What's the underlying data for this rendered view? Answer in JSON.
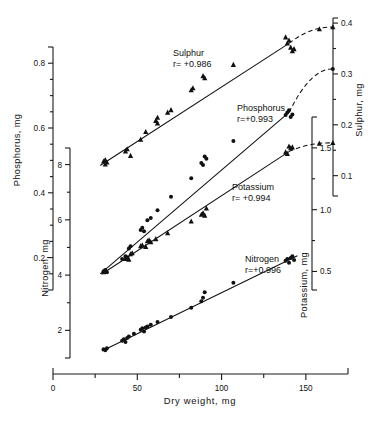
{
  "chart_data": {
    "type": "scatter",
    "title": "",
    "xlabel": "Dry weight,   mg",
    "xlim": [
      0,
      175
    ],
    "xticks": [
      0,
      50,
      100,
      150
    ],
    "xminorticks": [
      25,
      75,
      125
    ],
    "grid": false,
    "legend_position": "inline-annotations",
    "axes": [
      {
        "name": "phosphorus-axis",
        "title": "Phosphorus,   mg",
        "side": "left",
        "position_index": 1,
        "lim": [
          0.1,
          0.85
        ],
        "ticks": [
          0.2,
          0.4,
          0.6,
          0.8
        ],
        "ticklabels": [
          "0.2",
          "0.4",
          "0.6",
          "0.8"
        ],
        "minorticks": [
          0.15,
          0.25,
          0.3,
          0.35,
          0.45,
          0.5,
          0.55,
          0.65,
          0.7,
          0.75
        ]
      },
      {
        "name": "nitrogen-axis",
        "title": "Nitrogen,   mg",
        "side": "left",
        "position_index": 2,
        "lim": [
          1.0,
          8.6
        ],
        "ticks": [
          2,
          4,
          6,
          8
        ],
        "ticklabels": [
          "2",
          "4",
          "6",
          "8"
        ],
        "minorticks": [
          3,
          5,
          7
        ]
      },
      {
        "name": "potassium-axis",
        "title": "Potassium,   mg",
        "side": "right",
        "position_index": 1,
        "lim": [
          0.35,
          1.75
        ],
        "ticks": [
          0.5,
          1.0,
          1.5
        ],
        "ticklabels": [
          "0.5",
          "1.0",
          "1.5"
        ],
        "minorticks": [
          0.75,
          1.25
        ]
      },
      {
        "name": "sulphur-axis",
        "title": "Sulphur,   mg",
        "side": "right",
        "position_index": 2,
        "lim": [
          0.06,
          0.41
        ],
        "ticks": [
          0.1,
          0.2,
          0.3,
          0.4
        ],
        "ticklabels": [
          "0.1",
          "0.2",
          "0.3",
          "0.4"
        ],
        "minorticks": [
          0.15,
          0.25,
          0.35
        ]
      }
    ],
    "series": [
      {
        "name": "Sulphur",
        "annotation": "Sulphur",
        "correlation_label": "r= +0.986",
        "r": 0.986,
        "marker": "triangle",
        "axis": "sulphur-axis",
        "points": [
          [
            30,
            0.128
          ],
          [
            31,
            0.131
          ],
          [
            31,
            0.122
          ],
          [
            32,
            0.126
          ],
          [
            43,
            0.148
          ],
          [
            44,
            0.152
          ],
          [
            46,
            0.139
          ],
          [
            52,
            0.171
          ],
          [
            55,
            0.186
          ],
          [
            61,
            0.208
          ],
          [
            62,
            0.214
          ],
          [
            62,
            0.203
          ],
          [
            68,
            0.224
          ],
          [
            70,
            0.229
          ],
          [
            82,
            0.268
          ],
          [
            83,
            0.272
          ],
          [
            89,
            0.296
          ],
          [
            90,
            0.292
          ],
          [
            107,
            0.318
          ],
          [
            138,
            0.372
          ],
          [
            139,
            0.36
          ],
          [
            140,
            0.366
          ],
          [
            141,
            0.352
          ],
          [
            142,
            0.345
          ],
          [
            143,
            0.349
          ],
          [
            158,
            0.388
          ],
          [
            166,
            0.392
          ]
        ],
        "fit_x": [
          28,
          140
        ],
        "fit_y": [
          0.12,
          0.36
        ],
        "tail_x": [
          140,
          166
        ],
        "tail_y": [
          0.36,
          0.392
        ]
      },
      {
        "name": "Phosphorus",
        "annotation": "Phosphorus",
        "correlation_label": "r=+0.993",
        "r": 0.993,
        "marker": "circle",
        "axis": "phosphorus-axis",
        "points": [
          [
            30,
            0.158
          ],
          [
            31,
            0.162
          ],
          [
            32,
            0.155
          ],
          [
            41,
            0.196
          ],
          [
            43,
            0.204
          ],
          [
            44,
            0.199
          ],
          [
            45,
            0.228
          ],
          [
            46,
            0.235
          ],
          [
            52,
            0.285
          ],
          [
            53,
            0.292
          ],
          [
            54,
            0.281
          ],
          [
            56,
            0.315
          ],
          [
            58,
            0.322
          ],
          [
            62,
            0.346
          ],
          [
            70,
            0.388
          ],
          [
            82,
            0.445
          ],
          [
            88,
            0.492
          ],
          [
            89,
            0.486
          ],
          [
            90,
            0.512
          ],
          [
            91,
            0.505
          ],
          [
            107,
            0.56
          ],
          [
            138,
            0.64
          ],
          [
            139,
            0.648
          ],
          [
            140,
            0.655
          ],
          [
            141,
            0.634
          ],
          [
            142,
            0.642
          ],
          [
            166,
            0.782
          ]
        ],
        "fit_x": [
          28,
          140
        ],
        "fit_y": [
          0.15,
          0.648
        ],
        "tail_x": [
          140,
          166
        ],
        "tail_y": [
          0.648,
          0.782
        ]
      },
      {
        "name": "Potassium",
        "annotation": "Potassium",
        "correlation_label": "r= +0.994",
        "r": 0.994,
        "marker": "triangle",
        "axis": "potassium-axis",
        "points": [
          [
            30,
            0.495
          ],
          [
            31,
            0.502
          ],
          [
            43,
            0.602
          ],
          [
            44,
            0.612
          ],
          [
            45,
            0.596
          ],
          [
            46,
            0.64
          ],
          [
            47,
            0.648
          ],
          [
            52,
            0.706
          ],
          [
            53,
            0.712
          ],
          [
            55,
            0.7
          ],
          [
            56,
            0.745
          ],
          [
            57,
            0.752
          ],
          [
            58,
            0.738
          ],
          [
            61,
            0.762
          ],
          [
            68,
            0.81
          ],
          [
            82,
            0.905
          ],
          [
            88,
            0.96
          ],
          [
            89,
            0.972
          ],
          [
            90,
            0.952
          ],
          [
            91,
            1.01
          ],
          [
            138,
            1.465
          ],
          [
            139,
            1.452
          ],
          [
            140,
            1.512
          ],
          [
            141,
            1.498
          ],
          [
            142,
            1.505
          ],
          [
            158,
            1.535
          ],
          [
            166,
            1.54
          ]
        ],
        "fit_x": [
          29,
          140
        ],
        "fit_y": [
          0.48,
          1.47
        ],
        "tail_x": [
          140,
          166
        ],
        "tail_y": [
          1.47,
          1.54
        ]
      },
      {
        "name": "Nitrogen",
        "annotation": "Nitrogen",
        "correlation_label": "r=+0.996",
        "r": 0.996,
        "marker": "circle",
        "axis": "nitrogen-axis",
        "points": [
          [
            30,
            1.32
          ],
          [
            31,
            1.28
          ],
          [
            32,
            1.35
          ],
          [
            41,
            1.62
          ],
          [
            42,
            1.68
          ],
          [
            43,
            1.58
          ],
          [
            44,
            1.72
          ],
          [
            45,
            1.78
          ],
          [
            48,
            1.88
          ],
          [
            52,
            2.02
          ],
          [
            53,
            2.08
          ],
          [
            54,
            1.96
          ],
          [
            55,
            2.1
          ],
          [
            56,
            2.14
          ],
          [
            58,
            2.2
          ],
          [
            62,
            2.3
          ],
          [
            70,
            2.48
          ],
          [
            82,
            2.82
          ],
          [
            88,
            3.05
          ],
          [
            89,
            3.18
          ],
          [
            90,
            3.38
          ],
          [
            107,
            3.72
          ],
          [
            138,
            4.52
          ],
          [
            139,
            4.58
          ],
          [
            140,
            4.45
          ],
          [
            141,
            4.62
          ],
          [
            142,
            4.68
          ],
          [
            143,
            4.55
          ]
        ],
        "fit_x": [
          29,
          145
        ],
        "fit_y": [
          1.25,
          4.7
        ],
        "tail_x": [
          145,
          145
        ],
        "tail_y": [
          4.7,
          4.7
        ]
      }
    ]
  },
  "annotations": {
    "sulphur_label": "Sulphur",
    "sulphur_r": "r= +0.986",
    "phosphorus_label": "Phosphorus",
    "phosphorus_r": "r=+0.993",
    "potassium_label": "Potassium",
    "potassium_r": "r= +0.994",
    "nitrogen_label": "Nitrogen",
    "nitrogen_r": "r=+0.996"
  },
  "colors": {
    "ink": "#111111",
    "background": "#ffffff"
  }
}
